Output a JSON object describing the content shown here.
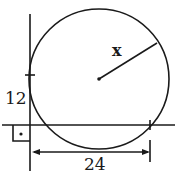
{
  "diagram": {
    "type": "geometry",
    "labels": {
      "radius": "x",
      "vertical_segment": "12",
      "horizontal_segment": "24"
    },
    "elements": {
      "circle": {
        "center": [
          99,
          79
        ],
        "radius": 70
      },
      "vertical_line": {
        "x": 30,
        "y1": 14,
        "y2": 171
      },
      "horizontal_line": {
        "y": 125,
        "x1": 2,
        "x2": 175
      },
      "tangent_tick_y": 75,
      "right_intersection_x": 150,
      "dimension_arrow": {
        "y": 151,
        "x1": 32,
        "x2": 150
      },
      "right_angle_marker": true
    },
    "colors": {
      "ink": "#1a1a1a",
      "background": "#ffffff"
    }
  }
}
